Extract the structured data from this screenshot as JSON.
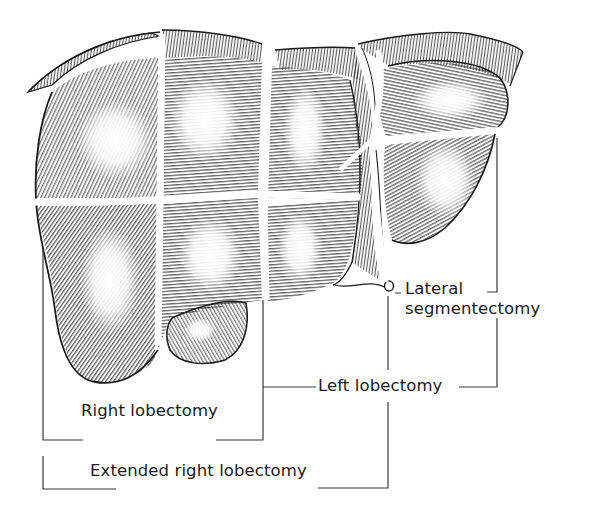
{
  "diagram": {
    "colors": {
      "ink": "#1a1a1a",
      "background": "#ffffff",
      "bracket": "#3a3a3a"
    },
    "labels": {
      "lateral_segmentectomy_line1": "Lateral",
      "lateral_segmentectomy_line2": "segmentectomy",
      "left_lobectomy": "Left lobectomy",
      "right_lobectomy": "Right lobectomy",
      "extended_right_lobectomy": "Extended right lobectomy"
    },
    "structures": [
      {
        "name": "right-lobe",
        "role": "anatomy"
      },
      {
        "name": "left-lobe",
        "role": "anatomy"
      },
      {
        "name": "falciform-ligament",
        "role": "anatomy"
      },
      {
        "name": "gallbladder",
        "role": "anatomy"
      },
      {
        "name": "ligamentum-teres",
        "role": "anatomy"
      }
    ]
  }
}
